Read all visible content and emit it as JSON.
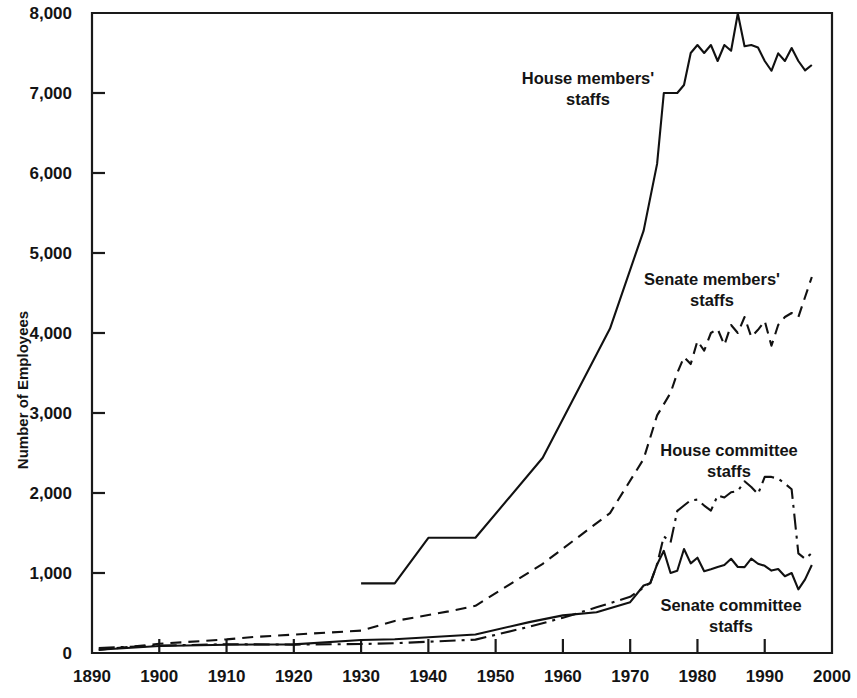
{
  "chart_data": {
    "type": "line",
    "title": "",
    "xlabel": "",
    "ylabel": "Number of Employees",
    "xlim": [
      1890,
      2000
    ],
    "ylim": [
      0,
      8000
    ],
    "grid": false,
    "legend_position": "inline-annotations",
    "xticks": [
      "1890",
      "1900",
      "1910",
      "1920",
      "1930",
      "1940",
      "1950",
      "1960",
      "1970",
      "1980",
      "1990",
      "2000"
    ],
    "yticks": [
      "0",
      "1,000",
      "2,000",
      "3,000",
      "4,000",
      "5,000",
      "6,000",
      "7,000",
      "8,000"
    ],
    "series": [
      {
        "name": "House members' staffs",
        "style": "solid",
        "label_lines": [
          "House members'",
          "staffs"
        ],
        "x": [
          1930,
          1935,
          1940,
          1947,
          1957,
          1967,
          1972,
          1974,
          1975,
          1976,
          1977,
          1978,
          1979,
          1980,
          1981,
          1982,
          1983,
          1984,
          1985,
          1986,
          1987,
          1988,
          1989,
          1990,
          1991,
          1992,
          1993,
          1994,
          1995,
          1996,
          1997
        ],
        "values": [
          870,
          870,
          1440,
          1440,
          2441,
          4055,
          5280,
          6114,
          7000,
          7000,
          7000,
          7100,
          7500,
          7600,
          7500,
          7600,
          7400,
          7600,
          7528,
          7994,
          7584,
          7600,
          7569,
          7400,
          7278,
          7496,
          7400,
          7562,
          7400,
          7282,
          7350
        ]
      },
      {
        "name": "Senate members' staffs",
        "style": "dashed",
        "label_lines": [
          "Senate members'",
          "staffs"
        ],
        "x": [
          1891,
          1900,
          1910,
          1914,
          1920,
          1930,
          1935,
          1943,
          1947,
          1957,
          1967,
          1972,
          1974,
          1976,
          1977,
          1978,
          1979,
          1980,
          1981,
          1982,
          1983,
          1984,
          1985,
          1986,
          1987,
          1988,
          1989,
          1990,
          1991,
          1992,
          1993,
          1994,
          1995,
          1996,
          1997
        ],
        "values": [
          39,
          115,
          170,
          200,
          230,
          280,
          400,
          520,
          590,
          1115,
          1749,
          2426,
          2970,
          3251,
          3500,
          3700,
          3612,
          3900,
          3780,
          4000,
          4050,
          3850,
          4100,
          4000,
          4200,
          3950,
          4040,
          4150,
          3840,
          4100,
          4200,
          4250,
          4200,
          4450,
          4700
        ]
      },
      {
        "name": "House committee staffs",
        "style": "dashdot",
        "label_lines": [
          "House committee",
          "staffs"
        ],
        "x": [
          1891,
          1900,
          1910,
          1920,
          1930,
          1935,
          1947,
          1955,
          1960,
          1965,
          1970,
          1972,
          1973,
          1974,
          1975,
          1976,
          1977,
          1978,
          1979,
          1980,
          1981,
          1982,
          1983,
          1984,
          1985,
          1986,
          1987,
          1988,
          1989,
          1990,
          1991,
          1992,
          1993,
          1994,
          1995,
          1996,
          1997
        ],
        "values": [
          62,
          92,
          110,
          105,
          112,
          122,
          167,
          329,
          440,
          571,
          702,
          817,
          878,
          1107,
          1460,
          1380,
          1776,
          1844,
          1909,
          1917,
          1843,
          1779,
          1970,
          1944,
          2009,
          2024,
          2146,
          2075,
          1986,
          2201,
          2201,
          2178,
          2118,
          2046,
          1246,
          1177,
          1250
        ]
      },
      {
        "name": "Senate committee staffs",
        "style": "solid",
        "label_lines": [
          "Senate committee",
          "staffs"
        ],
        "x": [
          1891,
          1900,
          1910,
          1920,
          1930,
          1935,
          1947,
          1955,
          1960,
          1965,
          1970,
          1972,
          1973,
          1974,
          1975,
          1976,
          1977,
          1978,
          1979,
          1980,
          1981,
          1982,
          1983,
          1984,
          1985,
          1986,
          1987,
          1988,
          1989,
          1990,
          1991,
          1992,
          1993,
          1994,
          1995,
          1996,
          1997
        ],
        "values": [
          41,
          87,
          104,
          108,
          163,
          172,
          232,
          386,
          470,
          509,
          635,
          844,
          873,
          1107,
          1277,
          1000,
          1028,
          1300,
          1120,
          1191,
          1022,
          1047,
          1075,
          1100,
          1178,
          1075,
          1074,
          1180,
          1116,
          1090,
          1030,
          1050,
          960,
          1000,
          795,
          920,
          1100
        ]
      }
    ]
  },
  "axes": {
    "y_axis_title": "Number of Employees"
  }
}
